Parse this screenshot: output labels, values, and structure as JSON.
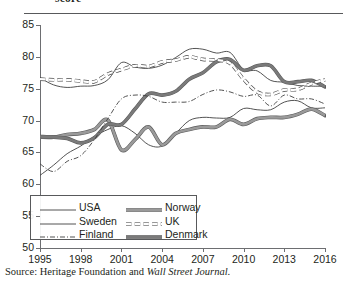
{
  "header": {
    "title_fragment": "score",
    "rule": "divider"
  },
  "source": {
    "prefix": "Source: Heritage Foundation and ",
    "italic": "Wall Street Journal",
    "suffix": "."
  },
  "chart_data": {
    "type": "line",
    "title": "score",
    "xlabel": "",
    "ylabel": "",
    "xlim": [
      1995,
      2016
    ],
    "ylim": [
      50,
      85
    ],
    "yticks": [
      50,
      55,
      60,
      65,
      70,
      75,
      80,
      85
    ],
    "xticks": [
      1995,
      1998,
      2001,
      2004,
      2007,
      2010,
      2013,
      2016
    ],
    "grid": false,
    "legend_position": "lower-left",
    "x": [
      1995,
      1996,
      1997,
      1998,
      1999,
      2000,
      2001,
      2002,
      2003,
      2004,
      2005,
      2006,
      2007,
      2008,
      2009,
      2010,
      2011,
      2012,
      2013,
      2014,
      2015,
      2016
    ],
    "series": [
      {
        "name": "USA",
        "style": "thin-solid",
        "color": "#4d4d4d",
        "values": [
          76.7,
          75.6,
          75.2,
          75.4,
          75.5,
          76.4,
          79.1,
          78.4,
          78.2,
          78.7,
          79.9,
          81.2,
          81.2,
          80.6,
          80.7,
          78.0,
          77.8,
          76.3,
          76.0,
          75.5,
          75.4,
          75.4
        ]
      },
      {
        "name": "Sweden",
        "style": "thin-solid",
        "color": "#4d4d4d",
        "values": [
          61.4,
          63.0,
          64.8,
          66.0,
          67.5,
          68.6,
          69.2,
          68.0,
          66.2,
          66.0,
          68.0,
          70.0,
          70.5,
          70.4,
          70.5,
          71.9,
          71.7,
          71.7,
          72.9,
          73.1,
          72.0,
          72.0
        ]
      },
      {
        "name": "Finland",
        "style": "dash-dot",
        "color": "#4d4d4d",
        "values": [
          63.2,
          62.0,
          63.6,
          64.5,
          67.0,
          70.3,
          73.4,
          74.0,
          73.8,
          72.9,
          72.9,
          73.0,
          74.1,
          74.8,
          74.5,
          73.8,
          74.0,
          72.3,
          74.0,
          73.4,
          73.4,
          72.6
        ]
      },
      {
        "name": "Norway",
        "style": "thick-gray",
        "color": "#808080",
        "values": [
          67.4,
          67.4,
          67.8,
          68.0,
          68.6,
          70.1,
          65.4,
          67.0,
          69.0,
          66.2,
          68.0,
          68.6,
          69.0,
          69.0,
          70.2,
          69.4,
          70.3,
          70.5,
          70.5,
          71.0,
          71.8,
          70.8
        ]
      },
      {
        "name": "UK",
        "style": "dashed",
        "color": "#4d4d4d",
        "values": [
          76.5,
          76.4,
          76.4,
          76.2,
          76.1,
          77.3,
          78.0,
          78.6,
          78.5,
          79.2,
          79.5,
          80.0,
          79.6,
          79.5,
          79.0,
          76.5,
          74.5,
          74.1,
          74.8,
          74.9,
          75.8,
          76.4
        ]
      },
      {
        "name": "Denmark",
        "style": "thick-dark",
        "color": "#6e6e6e",
        "values": [
          67.5,
          67.4,
          67.2,
          66.5,
          67.3,
          69.4,
          69.4,
          71.8,
          74.2,
          74.0,
          74.6,
          76.5,
          77.5,
          79.2,
          79.6,
          77.9,
          78.6,
          78.6,
          76.1,
          76.1,
          76.3,
          75.3
        ]
      }
    ]
  },
  "legend": {
    "entries": [
      {
        "label": "USA",
        "style": "thin-solid"
      },
      {
        "label": "Sweden",
        "style": "thin-solid"
      },
      {
        "label": "Finland",
        "style": "dash-dot"
      },
      {
        "label": "Norway",
        "style": "thick-gray"
      },
      {
        "label": "UK",
        "style": "dashed"
      },
      {
        "label": "Denmark",
        "style": "thick-dark"
      }
    ]
  },
  "axis": {
    "y_tick_labels": [
      "85",
      "80",
      "75",
      "70",
      "65",
      "60",
      "55",
      "50"
    ],
    "x_tick_labels": [
      "1995",
      "1998",
      "2001",
      "2004",
      "2007",
      "2010",
      "2013",
      "2016"
    ]
  }
}
